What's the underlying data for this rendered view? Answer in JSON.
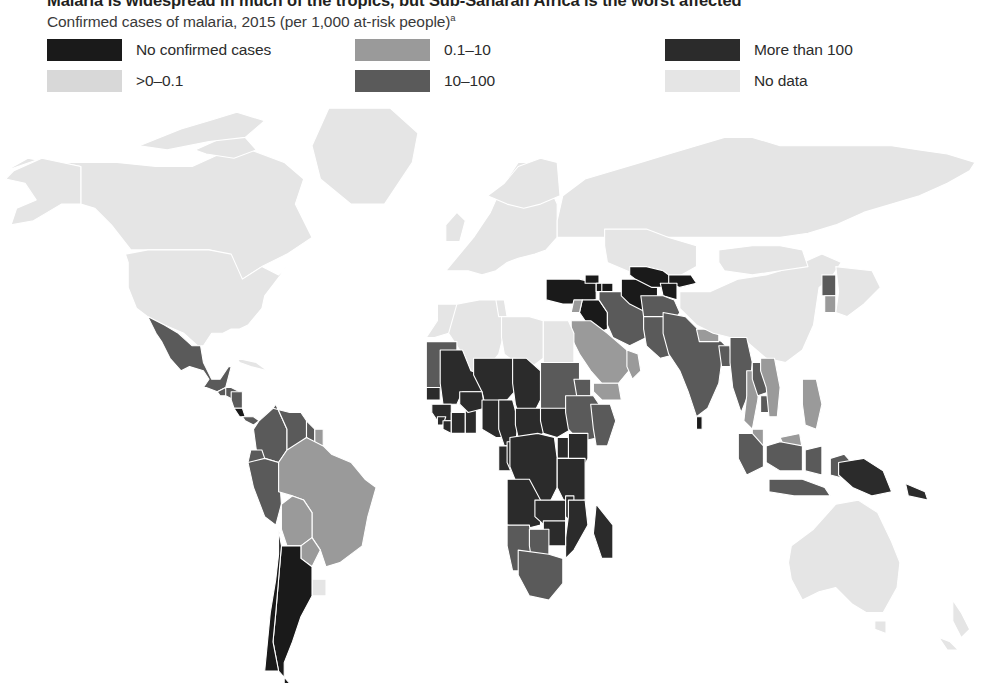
{
  "header": {
    "title": "Malaria is widespread in much of the tropics, but Sub-Saharan Africa is the worst affected",
    "subtitle": "Confirmed cases of malaria, 2015 (per 1,000 at-risk people)",
    "subtitle_footnote_marker": "a"
  },
  "legend": {
    "columns": [
      {
        "items": [
          {
            "label": "No confirmed cases",
            "color": "#1a1a1a"
          },
          {
            "label": ">0–0.1",
            "color": "#d8d8d8"
          }
        ]
      },
      {
        "items": [
          {
            "label": "0.1–10",
            "color": "#9a9a9a"
          },
          {
            "label": "10–100",
            "color": "#5a5a5a"
          }
        ]
      },
      {
        "items": [
          {
            "label": "More than 100",
            "color": "#2b2b2b"
          },
          {
            "label": "No data",
            "color": "#e5e5e5"
          }
        ]
      }
    ]
  },
  "chart_data": {
    "type": "map",
    "map_kind": "choropleth",
    "projection": "equirectangular-world",
    "title": "Malaria is widespread in much of the tropics, but Sub-Saharan Africa is the worst affected",
    "subtitle": "Confirmed cases of malaria, 2015 (per 1,000 at-risk people)",
    "unit": "confirmed cases of malaria per 1,000 at-risk people",
    "year": 2015,
    "legend_position": "top",
    "categories": [
      {
        "label": "No confirmed cases",
        "color": "#1a1a1a"
      },
      {
        "label": ">0–0.1",
        "color": "#d8d8d8"
      },
      {
        "label": "0.1–10",
        "color": "#9a9a9a"
      },
      {
        "label": "10–100",
        "color": "#5a5a5a"
      },
      {
        "label": "More than 100",
        "color": "#2b2b2b"
      },
      {
        "label": "No data",
        "color": "#e5e5e5"
      }
    ],
    "regions": [
      {
        "name": "Canada",
        "category": "No data"
      },
      {
        "name": "United States",
        "category": "No data"
      },
      {
        "name": "Greenland",
        "category": "No data"
      },
      {
        "name": "Mexico",
        "category": "10–100"
      },
      {
        "name": "Guatemala",
        "category": "10–100"
      },
      {
        "name": "Honduras",
        "category": "10–100"
      },
      {
        "name": "Nicaragua",
        "category": "10–100"
      },
      {
        "name": "Costa Rica",
        "category": "No confirmed cases"
      },
      {
        "name": "Panama",
        "category": "10–100"
      },
      {
        "name": "Cuba",
        "category": "No data"
      },
      {
        "name": "Colombia",
        "category": "10–100"
      },
      {
        "name": "Venezuela",
        "category": "10–100"
      },
      {
        "name": "Guyana",
        "category": "10–100"
      },
      {
        "name": "Suriname",
        "category": "0.1–10"
      },
      {
        "name": "Ecuador",
        "category": "10–100"
      },
      {
        "name": "Peru",
        "category": "10–100"
      },
      {
        "name": "Brazil",
        "category": "0.1–10"
      },
      {
        "name": "Bolivia",
        "category": "0.1–10"
      },
      {
        "name": "Paraguay",
        "category": "0.1–10"
      },
      {
        "name": "Uruguay",
        "category": "No data"
      },
      {
        "name": "Argentina",
        "category": "No confirmed cases"
      },
      {
        "name": "Chile",
        "category": "No confirmed cases"
      },
      {
        "name": "Western Europe",
        "category": "No data"
      },
      {
        "name": "Russia",
        "category": "No data"
      },
      {
        "name": "Turkey",
        "category": "No confirmed cases"
      },
      {
        "name": "Georgia",
        "category": "No confirmed cases"
      },
      {
        "name": "Armenia",
        "category": "No confirmed cases"
      },
      {
        "name": "Azerbaijan",
        "category": "No confirmed cases"
      },
      {
        "name": "Iraq",
        "category": "No confirmed cases"
      },
      {
        "name": "Uzbekistan",
        "category": "No confirmed cases"
      },
      {
        "name": "Turkmenistan",
        "category": "No confirmed cases"
      },
      {
        "name": "Kyrgyzstan",
        "category": "No confirmed cases"
      },
      {
        "name": "Tajikistan",
        "category": "No confirmed cases"
      },
      {
        "name": "Kazakhstan",
        "category": "No data"
      },
      {
        "name": "Iran",
        "category": "10–100"
      },
      {
        "name": "Saudi Arabia",
        "category": "0.1–10"
      },
      {
        "name": "Yemen",
        "category": "0.1–10"
      },
      {
        "name": "Oman",
        "category": "0.1–10"
      },
      {
        "name": "Syria",
        "category": "0.1–10"
      },
      {
        "name": "Morocco",
        "category": "No data"
      },
      {
        "name": "Algeria",
        "category": "No data"
      },
      {
        "name": "Libya",
        "category": "No data"
      },
      {
        "name": "Egypt",
        "category": "No data"
      },
      {
        "name": "Tunisia",
        "category": "No data"
      },
      {
        "name": "Mauritania",
        "category": "10–100"
      },
      {
        "name": "Mali",
        "category": "More than 100"
      },
      {
        "name": "Niger",
        "category": "More than 100"
      },
      {
        "name": "Chad",
        "category": "More than 100"
      },
      {
        "name": "Sudan",
        "category": "10–100"
      },
      {
        "name": "Senegal",
        "category": "More than 100"
      },
      {
        "name": "Guinea",
        "category": "More than 100"
      },
      {
        "name": "Sierra Leone",
        "category": "More than 100"
      },
      {
        "name": "Liberia",
        "category": "More than 100"
      },
      {
        "name": "Cote d'Ivoire",
        "category": "More than 100"
      },
      {
        "name": "Ghana",
        "category": "More than 100"
      },
      {
        "name": "Burkina Faso",
        "category": "More than 100"
      },
      {
        "name": "Nigeria",
        "category": "More than 100"
      },
      {
        "name": "Cameroon",
        "category": "More than 100"
      },
      {
        "name": "Central African Republic",
        "category": "More than 100"
      },
      {
        "name": "South Sudan",
        "category": "More than 100"
      },
      {
        "name": "Ethiopia",
        "category": "10–100"
      },
      {
        "name": "Eritrea",
        "category": "10–100"
      },
      {
        "name": "Somalia",
        "category": "10–100"
      },
      {
        "name": "Kenya",
        "category": "More than 100"
      },
      {
        "name": "Uganda",
        "category": "More than 100"
      },
      {
        "name": "Democratic Republic of the Congo",
        "category": "More than 100"
      },
      {
        "name": "Congo",
        "category": "More than 100"
      },
      {
        "name": "Gabon",
        "category": "More than 100"
      },
      {
        "name": "Angola",
        "category": "More than 100"
      },
      {
        "name": "Tanzania",
        "category": "More than 100"
      },
      {
        "name": "Zambia",
        "category": "More than 100"
      },
      {
        "name": "Malawi",
        "category": "More than 100"
      },
      {
        "name": "Mozambique",
        "category": "More than 100"
      },
      {
        "name": "Zimbabwe",
        "category": "More than 100"
      },
      {
        "name": "Madagascar",
        "category": "More than 100"
      },
      {
        "name": "Namibia",
        "category": "10–100"
      },
      {
        "name": "Botswana",
        "category": "10–100"
      },
      {
        "name": "South Africa",
        "category": "10–100"
      },
      {
        "name": "Afghanistan",
        "category": "10–100"
      },
      {
        "name": "Pakistan",
        "category": "10–100"
      },
      {
        "name": "India",
        "category": "10–100"
      },
      {
        "name": "Nepal",
        "category": "0.1–10"
      },
      {
        "name": "Bangladesh",
        "category": "10–100"
      },
      {
        "name": "Sri Lanka",
        "category": "No confirmed cases"
      },
      {
        "name": "China",
        "category": "No data"
      },
      {
        "name": "Mongolia",
        "category": "No data"
      },
      {
        "name": "North Korea",
        "category": "10–100"
      },
      {
        "name": "South Korea",
        "category": "0.1–10"
      },
      {
        "name": "Japan",
        "category": "No data"
      },
      {
        "name": "Myanmar",
        "category": "10–100"
      },
      {
        "name": "Thailand",
        "category": "0.1–10"
      },
      {
        "name": "Laos",
        "category": "10–100"
      },
      {
        "name": "Cambodia",
        "category": "10–100"
      },
      {
        "name": "Vietnam",
        "category": "0.1–10"
      },
      {
        "name": "Malaysia",
        "category": "0.1–10"
      },
      {
        "name": "Indonesia",
        "category": "10–100"
      },
      {
        "name": "Philippines",
        "category": "0.1–10"
      },
      {
        "name": "Papua New Guinea",
        "category": "More than 100"
      },
      {
        "name": "Solomon Islands",
        "category": "More than 100"
      },
      {
        "name": "Australia",
        "category": "No data"
      },
      {
        "name": "New Zealand",
        "category": "No data"
      }
    ]
  }
}
